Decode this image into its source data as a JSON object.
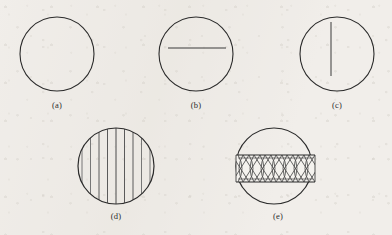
{
  "figure": {
    "background_color": "#f1eeea",
    "ink_color": "#2b2b2b",
    "hatch_color": "#555555",
    "panels": [
      {
        "id": "a",
        "caption": "(a)",
        "description": "empty-circle",
        "circle": {
          "cx": 57,
          "cy": 54,
          "r": 37
        },
        "caption_x": 37,
        "caption_y": 100
      },
      {
        "id": "b",
        "caption": "(b)",
        "description": "circle-with-horizontal-chord",
        "circle": {
          "cx": 196,
          "cy": 54,
          "r": 37
        },
        "chord": {
          "x1": 168,
          "y1": 48,
          "x2": 226,
          "y2": 48
        },
        "caption_x": 176,
        "caption_y": 100
      },
      {
        "id": "c",
        "caption": "(c)",
        "description": "circle-with-vertical-chord",
        "circle": {
          "cx": 337,
          "cy": 54,
          "r": 37
        },
        "chord": {
          "x1": 331,
          "y1": 22,
          "x2": 331,
          "y2": 76
        },
        "caption_x": 317,
        "caption_y": 100
      },
      {
        "id": "d",
        "caption": "(d)",
        "description": "circle-with-vertical-striping",
        "circle": {
          "cx": 116,
          "cy": 166,
          "r": 39
        },
        "stripe_count": 9,
        "stripe_spacing": 8.5,
        "caption_x": 96,
        "caption_y": 211
      },
      {
        "id": "e",
        "caption": "(e)",
        "description": "circle-with-crosshatched-band",
        "circle": {
          "cx": 274,
          "cy": 166,
          "r": 39
        },
        "band": {
          "top": 155,
          "bottom": 182,
          "left": 238,
          "right": 313
        },
        "weave_count": 7,
        "caption_x": 258,
        "caption_y": 211
      }
    ]
  }
}
